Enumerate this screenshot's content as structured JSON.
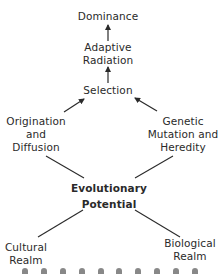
{
  "diagram": {
    "nodes": {
      "dominance": [
        "Dominance"
      ],
      "adaptive_radiation": [
        "Adaptive",
        "Radiation"
      ],
      "selection": [
        "Selection"
      ],
      "origination": [
        "Origination",
        "and",
        "Diffusion"
      ],
      "genetic": [
        "Genetic",
        "Mutation and",
        "Heredity"
      ],
      "evolutionary_potential": [
        "Evolutionary",
        "Potential"
      ],
      "cultural": [
        "Cultural",
        "Realm"
      ],
      "biological": [
        "Biological",
        "Realm"
      ]
    },
    "edges": [
      {
        "from": "adaptive_radiation",
        "to": "dominance",
        "type": "arrow"
      },
      {
        "from": "selection",
        "to": "adaptive_radiation",
        "type": "arrow"
      },
      {
        "from": "origination",
        "to": "selection",
        "type": "arrow"
      },
      {
        "from": "genetic",
        "to": "selection",
        "type": "arrow"
      },
      {
        "from": "origination",
        "to": "evolutionary_potential",
        "type": "line"
      },
      {
        "from": "genetic",
        "to": "evolutionary_potential",
        "type": "line"
      },
      {
        "from": "cultural",
        "to": "evolutionary_potential",
        "type": "line"
      },
      {
        "from": "biological",
        "to": "evolutionary_potential",
        "type": "line"
      }
    ],
    "colors": {
      "ink": "#2a2a2a",
      "background": "#ffffff"
    }
  }
}
